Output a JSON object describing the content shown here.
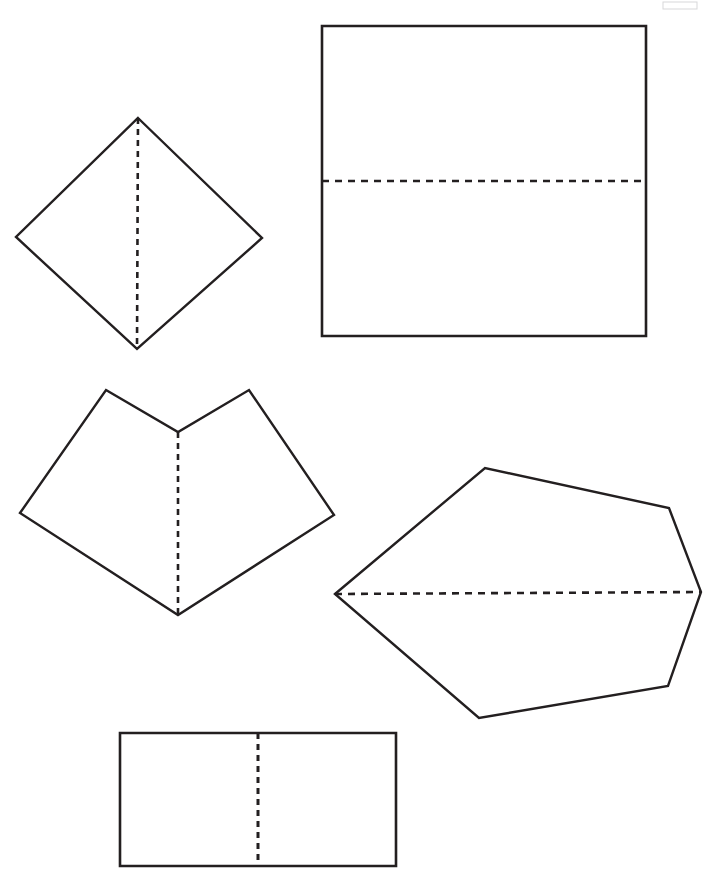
{
  "page": {
    "background_color": "#ffffff",
    "stroke_color": "#231f20",
    "width": 726,
    "height": 880
  },
  "figures": [
    {
      "id": "diamond",
      "name": "diamond-quadrilateral",
      "label": "Diamond",
      "stroke_width": 2.4,
      "outline_points": "138,118 262,238 137,349 16,237",
      "symmetry_line": {
        "x1": 138,
        "y1": 118,
        "x2": 137,
        "y2": 349,
        "style": "dashed",
        "orientation": "vertical",
        "dash_pattern": "6,5",
        "stroke_width": 2.6
      }
    },
    {
      "id": "square",
      "name": "square",
      "label": "Square",
      "stroke_width": 2.6,
      "outline_points": "322,26 646,26 646,336 322,336",
      "symmetry_line": {
        "x1": 322,
        "y1": 181,
        "x2": 646,
        "y2": 181,
        "style": "dashed",
        "orientation": "horizontal",
        "dash_pattern": "7,6",
        "stroke_width": 2.6
      }
    },
    {
      "id": "chevron",
      "name": "concave-chevron-hexagon",
      "label": "Chevron",
      "stroke_width": 2.4,
      "outline_points": "106,390 178,432 249,390 334,515 178,615 20,513",
      "symmetry_line": {
        "x1": 178,
        "y1": 432,
        "x2": 178,
        "y2": 615,
        "style": "dashed",
        "orientation": "vertical",
        "dash_pattern": "6,5",
        "stroke_width": 2.6
      }
    },
    {
      "id": "hexagon",
      "name": "irregular-hexagon",
      "label": "Hexagon",
      "stroke_width": 2.4,
      "outline_points": "335,594 485,468 669,508 701,592 668,686 479,718",
      "symmetry_line": {
        "x1": 335,
        "y1": 594,
        "x2": 701,
        "y2": 592,
        "style": "dashed",
        "orientation": "horizontal",
        "dash_pattern": "7,6",
        "stroke_width": 2.6
      }
    },
    {
      "id": "rectangle",
      "name": "rectangle",
      "label": "Rectangle",
      "stroke_width": 2.6,
      "outline_points": "120,733 396,733 396,866 120,866",
      "symmetry_line": {
        "x1": 258,
        "y1": 733,
        "x2": 258,
        "y2": 866,
        "style": "dashed",
        "orientation": "vertical",
        "dash_pattern": "6,5",
        "stroke_width": 3
      }
    }
  ],
  "artifacts": [
    {
      "id": "corner-smudge",
      "name": "page-edge-artifact",
      "x": 663,
      "y": 2,
      "width": 34,
      "height": 7,
      "color": "#e9e9ec"
    }
  ]
}
